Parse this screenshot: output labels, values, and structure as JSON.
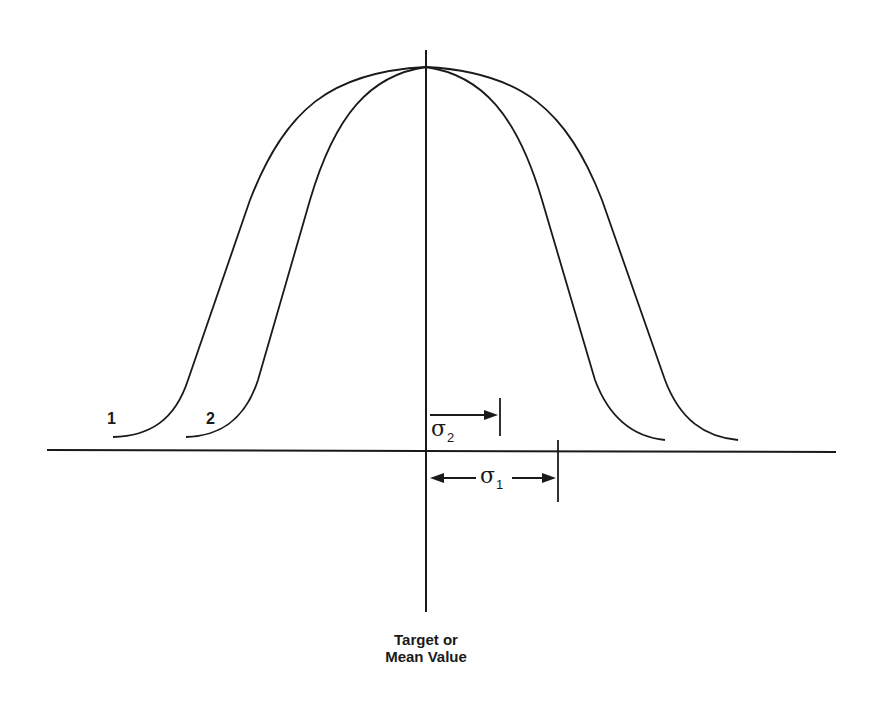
{
  "diagram": {
    "title": "",
    "curves": [
      {
        "id": "1",
        "label": "1",
        "description": "wider distribution",
        "sigma_label": "σ",
        "sigma_sub": "1"
      },
      {
        "id": "2",
        "label": "2",
        "description": "narrower distribution",
        "sigma_label": "σ",
        "sigma_sub": "2"
      }
    ],
    "center_axis_label_line1": "Target or",
    "center_axis_label_line2": "Mean Value",
    "line_color": "#1a1a1a",
    "background_color": "#ffffff"
  }
}
